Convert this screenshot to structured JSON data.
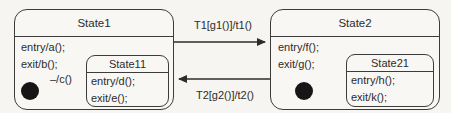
{
  "diagram": {
    "type": "uml-statechart",
    "state1": {
      "title": "State1",
      "entry": "entry/a();",
      "exit": "exit/b();",
      "initial_label": "–/c()",
      "substate": {
        "title": "State11",
        "entry": "entry/d();",
        "exit": "exit/e();"
      }
    },
    "state2": {
      "title": "State2",
      "entry": "entry/f();",
      "exit": "exit/g();",
      "substate": {
        "title": "State21",
        "entry": "entry/h();",
        "exit": "exit/k();"
      }
    },
    "transitions": {
      "t1_label": "T1[g1()]/t1()",
      "t2_label": "T2[g2()]/t2()"
    },
    "colors": {
      "line": "#3c3c3c",
      "state_fill": "#f8f7f4",
      "background": "#f6f5f2",
      "initial_dot": "#161616"
    }
  }
}
